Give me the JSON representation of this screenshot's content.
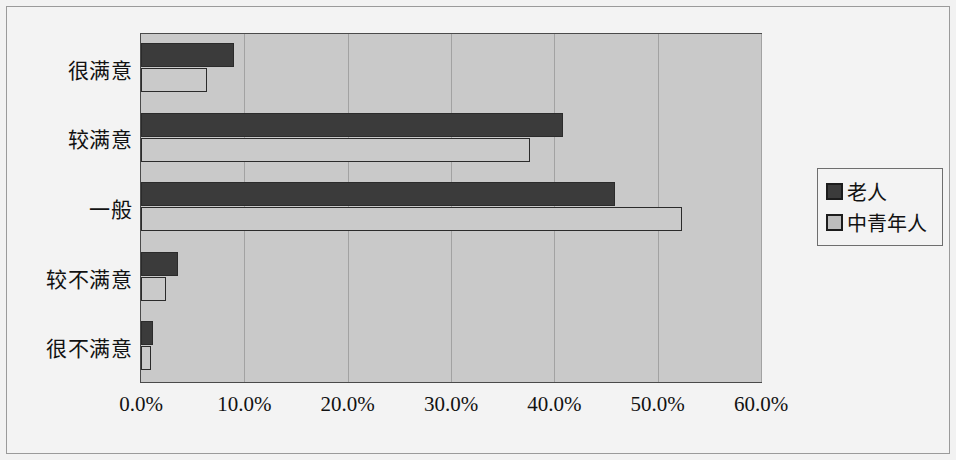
{
  "chart_data": {
    "type": "bar",
    "orientation": "horizontal",
    "title": "",
    "xlabel": "",
    "ylabel": "",
    "categories": [
      "很满意",
      "较满意",
      "一般",
      "较不满意",
      "很不满意"
    ],
    "series": [
      {
        "name": "老人",
        "color": "#3b3b3b",
        "values": [
          9.0,
          40.8,
          45.9,
          3.6,
          1.2
        ]
      },
      {
        "name": "中青年人",
        "color": "#cacaca",
        "values": [
          6.4,
          37.6,
          52.4,
          2.4,
          1.0
        ]
      }
    ],
    "xlim": [
      0,
      60
    ],
    "xticks": [
      0,
      10,
      20,
      30,
      40,
      50,
      60
    ],
    "xtick_labels": [
      "0.0%",
      "10.0%",
      "20.0%",
      "30.0%",
      "40.0%",
      "50.0%",
      "60.0%"
    ],
    "grid": true,
    "legend_position": "right",
    "plot_background": "#c9c9c9",
    "figure_background": "#f3f3f3"
  },
  "legend": {
    "items": [
      {
        "label": "老人"
      },
      {
        "label": "中青年人"
      }
    ]
  }
}
